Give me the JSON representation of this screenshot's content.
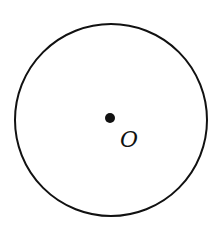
{
  "diagram": {
    "type": "geometry-circle",
    "circle": {
      "cx": 111,
      "cy": 120,
      "r": 96,
      "stroke": "#111111",
      "stroke_width": 2
    },
    "center_point": {
      "cx": 110,
      "cy": 118,
      "r": 5,
      "fill": "#111111"
    },
    "center_label": {
      "text": "O",
      "x": 120,
      "y": 147
    }
  }
}
